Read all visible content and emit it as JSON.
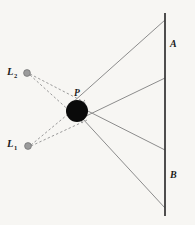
{
  "figure": {
    "background_color": "#f7f6f3",
    "width": 195,
    "height": 225,
    "labels": {
      "light_source_top": {
        "base": "L",
        "sub": "2",
        "name": "light-source-2-label"
      },
      "light_source_bottom": {
        "base": "L",
        "sub": "1",
        "name": "light-source-1-label"
      },
      "occluder_point": {
        "base": "P",
        "sub": "",
        "name": "point-p-label"
      },
      "screen_top": {
        "base": "A",
        "sub": "",
        "name": "region-a-label"
      },
      "screen_bottom": {
        "base": "B",
        "sub": "",
        "name": "region-b-label"
      }
    },
    "colors": {
      "sphere": "#0a0a0a",
      "ray_line": "#8c8c8c",
      "dashed_line": "#9a9a9a",
      "screen_line": "#3b3b3b",
      "source_dot": "#9b9b9b",
      "source_dot_edge": "#6e6e6e",
      "text": "#1b1b1b"
    },
    "geometry": {
      "sphere": {
        "cx": 77,
        "cy": 111,
        "r": 11
      },
      "source_top": {
        "cx": 27,
        "cy": 73,
        "r": 3.4
      },
      "source_bottom": {
        "cx": 28,
        "cy": 146,
        "r": 3.4
      },
      "screen": {
        "x": 165,
        "y_top": 13,
        "y_bottom": 216
      },
      "rays": [
        {
          "name": "ray-upper-from-p",
          "x1": 72,
          "y1": 103,
          "x2": 165,
          "y2": 20
        },
        {
          "name": "ray-mid-upper-from-sphere",
          "x1": 82,
          "y1": 118,
          "x2": 165,
          "y2": 78
        },
        {
          "name": "ray-mid-lower-from-p",
          "x1": 72,
          "y1": 103,
          "x2": 165,
          "y2": 150
        },
        {
          "name": "ray-lower-from-sphere",
          "x1": 82,
          "y1": 118,
          "x2": 165,
          "y2": 208
        }
      ],
      "dashed_rays": [
        {
          "name": "dashed-l2-upper-tangent",
          "x1": 30,
          "y1": 74,
          "x2": 86,
          "y2": 103
        },
        {
          "name": "dashed-l2-lower-tangent",
          "x1": 30,
          "y1": 75,
          "x2": 84,
          "y2": 124
        },
        {
          "name": "dashed-l1-upper-tangent",
          "x1": 31,
          "y1": 145,
          "x2": 85,
          "y2": 100
        },
        {
          "name": "dashed-l1-lower-tangent",
          "x1": 31,
          "y1": 146,
          "x2": 87,
          "y2": 120
        }
      ]
    }
  }
}
